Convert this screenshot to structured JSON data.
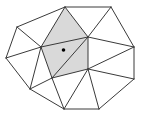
{
  "diagram": {
    "type": "triangulation",
    "colors": {
      "background": "#ffffff",
      "edge": "#3a3a3a",
      "shaded_region": "#d9d9d9",
      "point": "#000000"
    },
    "vertices": {
      "T": [
        65,
        7
      ],
      "TR": [
        111,
        7
      ],
      "UL": [
        17,
        27
      ],
      "A": [
        88,
        37
      ],
      "L": [
        41,
        47
      ],
      "R": [
        134,
        47
      ],
      "LL": [
        6,
        58
      ],
      "C": [
        88,
        69
      ],
      "P": [
        52,
        78
      ],
      "BR": [
        134,
        79
      ],
      "LB": [
        30,
        89
      ],
      "B1": [
        64,
        109
      ],
      "B2": [
        99,
        109
      ]
    },
    "shaded_polygon": [
      "T",
      "A",
      "C",
      "P",
      "L"
    ],
    "edges": [
      [
        "UL",
        "T"
      ],
      [
        "T",
        "TR"
      ],
      [
        "TR",
        "R"
      ],
      [
        "R",
        "BR"
      ],
      [
        "BR",
        "B2"
      ],
      [
        "B2",
        "B1"
      ],
      [
        "B1",
        "LB"
      ],
      [
        "LB",
        "LL"
      ],
      [
        "LL",
        "UL"
      ],
      [
        "UL",
        "L"
      ],
      [
        "T",
        "L"
      ],
      [
        "T",
        "A"
      ],
      [
        "TR",
        "A"
      ],
      [
        "L",
        "A"
      ],
      [
        "A",
        "P"
      ],
      [
        "A",
        "C"
      ],
      [
        "A",
        "R"
      ],
      [
        "R",
        "C"
      ],
      [
        "C",
        "BR"
      ],
      [
        "C",
        "P"
      ],
      [
        "C",
        "B2"
      ],
      [
        "C",
        "B1"
      ],
      [
        "P",
        "L"
      ],
      [
        "P",
        "B1"
      ],
      [
        "P",
        "LB"
      ],
      [
        "L",
        "LB"
      ],
      [
        "L",
        "LL"
      ]
    ],
    "point": {
      "x": 63.5,
      "y": 50,
      "r": 1.8
    }
  }
}
